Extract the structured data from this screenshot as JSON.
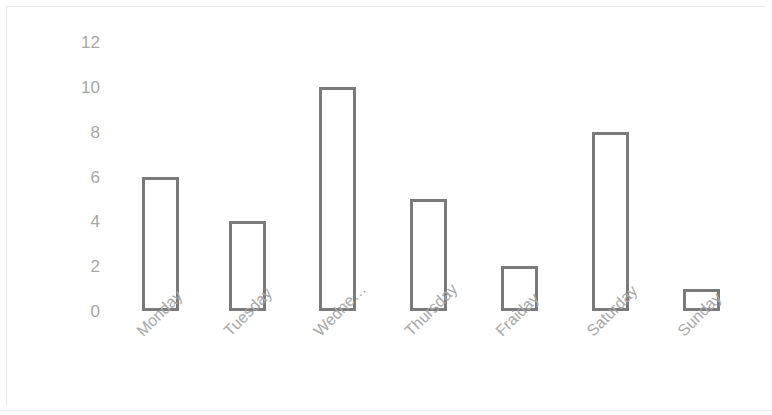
{
  "chart_data": {
    "type": "bar",
    "title": "",
    "subtitle": "",
    "xlabel": "",
    "ylabel": "",
    "categories": [
      "Monday",
      "Tuesday",
      "Wedne…",
      "Thursday",
      "Fraiday",
      "Saturday",
      "Sunday"
    ],
    "values": [
      6,
      4,
      10,
      5,
      2,
      8,
      1
    ],
    "ylim": [
      0,
      12
    ],
    "y_ticks": [
      0,
      2,
      4,
      6,
      8,
      10,
      12
    ],
    "y_tick_labels": [
      "0",
      "2",
      "4",
      "6",
      "8",
      "10",
      "12"
    ],
    "grid": false,
    "legend": false,
    "legend_position": "none",
    "bar_fill_color": "#ffffff",
    "bar_outline_color": "#7a7a7a",
    "tick_label_color": "#a6a6a6",
    "category_label_color": "#a8a8a8",
    "background_color": "#ffffff",
    "x_label_rotation_degrees": -45
  }
}
